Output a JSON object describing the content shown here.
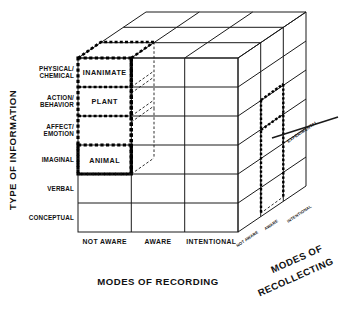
{
  "figure": {
    "title_y_axis": "TYPE OF INFORMATION",
    "title_x_axis": "MODES OF RECORDING",
    "title_z_axis_line1": "MODES OF",
    "title_z_axis_line2": "RECOLLECTING"
  },
  "y_axis": {
    "label": "TYPE OF INFORMATION",
    "rows": [
      {
        "line1": "PHYSICAL/",
        "line2": "CHEMICAL"
      },
      {
        "line1": "ACTION/",
        "line2": "BEHAVIOR"
      },
      {
        "line1": "AFFECT/",
        "line2": "EMOTION"
      },
      {
        "line1": "IMAGINAL",
        "line2": ""
      },
      {
        "line1": "VERBAL",
        "line2": ""
      },
      {
        "line1": "CONCEPTUAL",
        "line2": ""
      }
    ]
  },
  "x_axis": {
    "label": "MODES OF RECORDING",
    "columns": [
      "NOT AWARE",
      "AWARE",
      "INTENTIONAL"
    ]
  },
  "z_axis": {
    "label_line1": "MODES OF",
    "label_line2": "RECOLLECTING",
    "depths": [
      "NOT AWARE",
      "AWARE",
      "INTENTIONAL"
    ]
  },
  "cells": [
    {
      "row": "PHYSICAL/CHEMICAL",
      "column": "NOT AWARE",
      "text": "INANIMATE"
    },
    {
      "row": "ACTION/BEHAVIOR",
      "column": "NOT AWARE",
      "text": "PLANT"
    },
    {
      "row": "AFFECT/EMOTION",
      "column": "NOT AWARE",
      "text": ""
    },
    {
      "row": "IMAGINAL",
      "column": "NOT AWARE",
      "text": "ANIMAL"
    }
  ],
  "annotations": {
    "experimental": "EXPERIMENTAL"
  },
  "colors": {
    "line": "#1a1a1a",
    "background": "#ffffff",
    "highlight": "#000000"
  }
}
